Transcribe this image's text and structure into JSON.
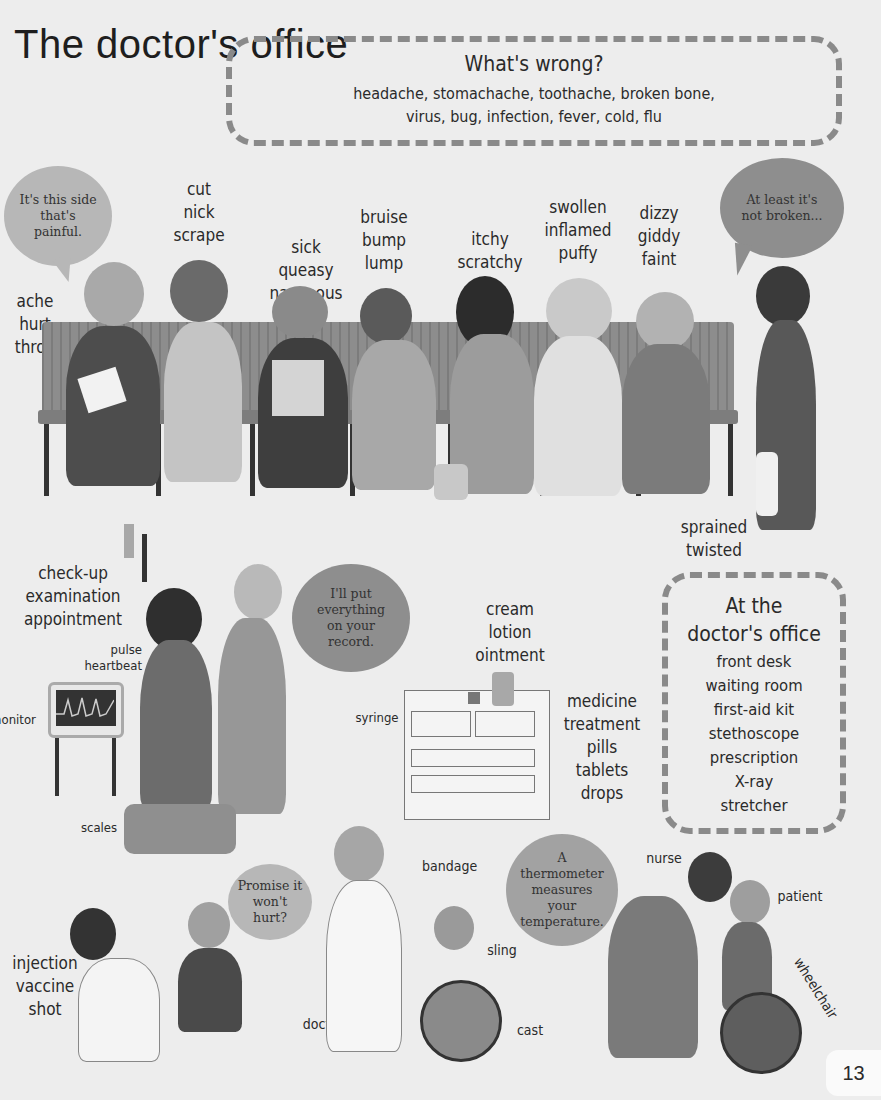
{
  "page": {
    "title": "The doctor's office",
    "page_number": "13"
  },
  "whats_wrong": {
    "heading": "What's wrong?",
    "line1": "headache, stomachache, toothache, broken bone,",
    "line2": "virus, bug, infection, fever, cold, flu"
  },
  "waiting_room": {
    "bubbles": [
      {
        "text": "It's this side that's painful."
      },
      {
        "text": "At least it's not broken..."
      }
    ],
    "word_groups": [
      {
        "words": [
          "ache",
          "hurt",
          "throb"
        ]
      },
      {
        "words": [
          "cut",
          "nick",
          "scrape"
        ]
      },
      {
        "words": [
          "sick",
          "queasy",
          "nauseous"
        ]
      },
      {
        "words": [
          "bruise",
          "bump",
          "lump"
        ]
      },
      {
        "words": [
          "itchy",
          "scratchy"
        ]
      },
      {
        "words": [
          "swollen",
          "inflamed",
          "puffy"
        ]
      },
      {
        "words": [
          "dizzy",
          "giddy",
          "faint"
        ]
      },
      {
        "words": [
          "sprained",
          "twisted"
        ]
      }
    ]
  },
  "checkup": {
    "words": [
      "check-up",
      "examination",
      "appointment"
    ],
    "pulse_words": [
      "pulse",
      "heartbeat"
    ],
    "monitor_label": "monitor",
    "scales_label": "scales",
    "bubble": "I'll put everything on your record."
  },
  "cabinet": {
    "cream_words": [
      "cream",
      "lotion",
      "ointment"
    ],
    "syringe_label": "syringe",
    "medicine_words": [
      "medicine",
      "treatment",
      "pills",
      "tablets",
      "drops"
    ]
  },
  "at_the_office": {
    "heading_line1": "At the",
    "heading_line2": "doctor's office",
    "items": [
      "front desk",
      "waiting room",
      "first-aid kit",
      "stethoscope",
      "prescription",
      "X-ray",
      "stretcher"
    ]
  },
  "bottom": {
    "injection_words": [
      "injection",
      "vaccine",
      "shot"
    ],
    "promise_bubble": "Promise it won't hurt?",
    "doctor_label": "doctor",
    "bandage_label": "bandage",
    "sling_label": "sling",
    "cast_label": "cast",
    "thermometer_bubble": "A thermometer measures your temperature.",
    "nurse_label": "nurse",
    "patient_label": "patient",
    "wheelchair_label": "wheelchair"
  }
}
